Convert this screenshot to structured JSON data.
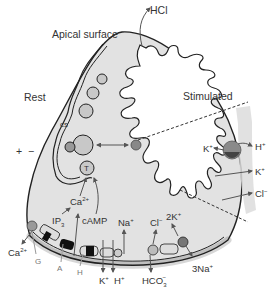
{
  "colors": {
    "cytoplasm": "#e2e2e2",
    "outline": "#222222",
    "vesicle": "#c8c8c8",
    "pump": "#7a7a7a",
    "pump_dark": "#444444",
    "membrane_band": "#d8d8d8",
    "arrow": "#555555"
  },
  "labels": {
    "apical_surface": "Apical surface",
    "hcl": "HCl",
    "rest": "Rest",
    "stimulated": "Stimulated",
    "cs": "cs",
    "sc": "sc",
    "t": "T",
    "plus": "+",
    "minus": "−",
    "ca_inside": "Ca",
    "ca_inside_sup": "2+",
    "ip3": "IP",
    "ip3_sub": "3",
    "camp": "cAMP",
    "na_in": "Na",
    "na_in_sup": "+",
    "cl_in": "Cl",
    "cl_in_sup": "−",
    "two_k": "2K",
    "two_k_sup": "+",
    "ca_out": "Ca",
    "ca_out_sup": "2+",
    "g": "G",
    "a": "A",
    "h": "H",
    "k_out": "K",
    "k_out_sup": "+",
    "h_out": "H",
    "h_out_sup": "+",
    "hco3": "HCO",
    "hco3_sub": "3",
    "hco3_sup": "−",
    "three_na": "3Na",
    "three_na_sup": "+",
    "inset_k_left": "K",
    "inset_k_left_sup": "+",
    "inset_h": "H",
    "inset_h_sup": "+",
    "inset_k": "K",
    "inset_k_sup": "+",
    "inset_cl": "Cl",
    "inset_cl_sup": "−"
  }
}
